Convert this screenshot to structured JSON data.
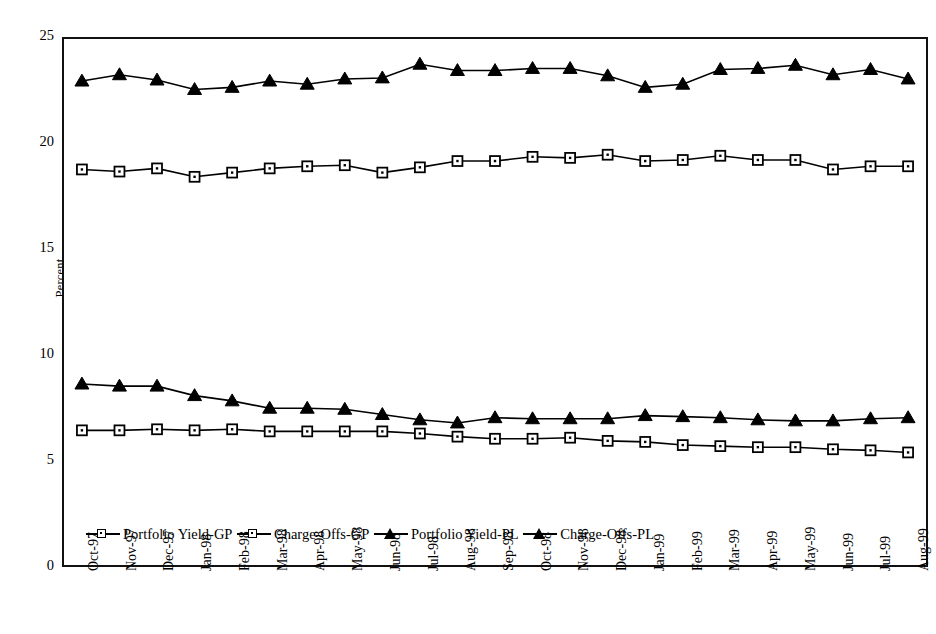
{
  "chart_data": {
    "type": "line",
    "title": "",
    "xlabel": "",
    "ylabel": "Percent",
    "ylim": [
      0,
      25
    ],
    "yticks": [
      25,
      20,
      15,
      10,
      5,
      0
    ],
    "grid": false,
    "legend_position": "inside-bottom-left",
    "categories": [
      "Oct-97",
      "Nov-97",
      "Dec-97",
      "Jan-98",
      "Feb-98",
      "Mar-98",
      "Apr-98",
      "May-98",
      "Jun-98",
      "Jul-98",
      "Aug-98",
      "Sep-98",
      "Oct-98",
      "Nov-98",
      "Dec-98",
      "Jan-99",
      "Feb-99",
      "Mar-99",
      "Apr-99",
      "May-99",
      "Jun-99",
      "Jul-99",
      "Aug-99"
    ],
    "series": [
      {
        "name": "Portfolio Yield-GP",
        "marker": "open-square",
        "values": [
          18.8,
          18.7,
          18.85,
          18.45,
          18.65,
          18.85,
          18.95,
          19.0,
          18.65,
          18.9,
          19.2,
          19.2,
          19.4,
          19.35,
          19.5,
          19.2,
          19.25,
          19.45,
          19.25,
          19.25,
          18.8,
          18.95,
          18.95
        ]
      },
      {
        "name": "Charge-Offs-GP",
        "marker": "open-square",
        "values": [
          6.4,
          6.4,
          6.45,
          6.4,
          6.45,
          6.35,
          6.35,
          6.35,
          6.35,
          6.25,
          6.1,
          6.0,
          6.0,
          6.05,
          5.9,
          5.85,
          5.7,
          5.65,
          5.6,
          5.6,
          5.5,
          5.45,
          5.35
        ]
      },
      {
        "name": "Portfolio Yield-PL",
        "marker": "filled-triangle",
        "values": [
          23.0,
          23.3,
          23.05,
          22.6,
          22.7,
          23.0,
          22.85,
          23.1,
          23.15,
          23.8,
          23.5,
          23.5,
          23.6,
          23.6,
          23.25,
          22.7,
          22.85,
          23.55,
          23.6,
          23.75,
          23.3,
          23.55,
          23.1
        ]
      },
      {
        "name": "Charge-Offs-PL",
        "marker": "filled-triangle",
        "values": [
          8.6,
          8.5,
          8.5,
          8.05,
          7.8,
          7.45,
          7.45,
          7.4,
          7.15,
          6.9,
          6.75,
          7.0,
          6.95,
          6.95,
          6.95,
          7.1,
          7.05,
          7.0,
          6.9,
          6.85,
          6.85,
          6.95,
          7.0
        ]
      }
    ]
  },
  "legend": {
    "items": [
      {
        "label": "Portfolio Yield-GP",
        "marker": "open-square"
      },
      {
        "label": "Charge-Offs-GP",
        "marker": "open-square"
      },
      {
        "label": "Portfolio Yield-PL",
        "marker": "filled-triangle"
      },
      {
        "label": "Charge-Offs-PL",
        "marker": "filled-triangle"
      }
    ]
  }
}
